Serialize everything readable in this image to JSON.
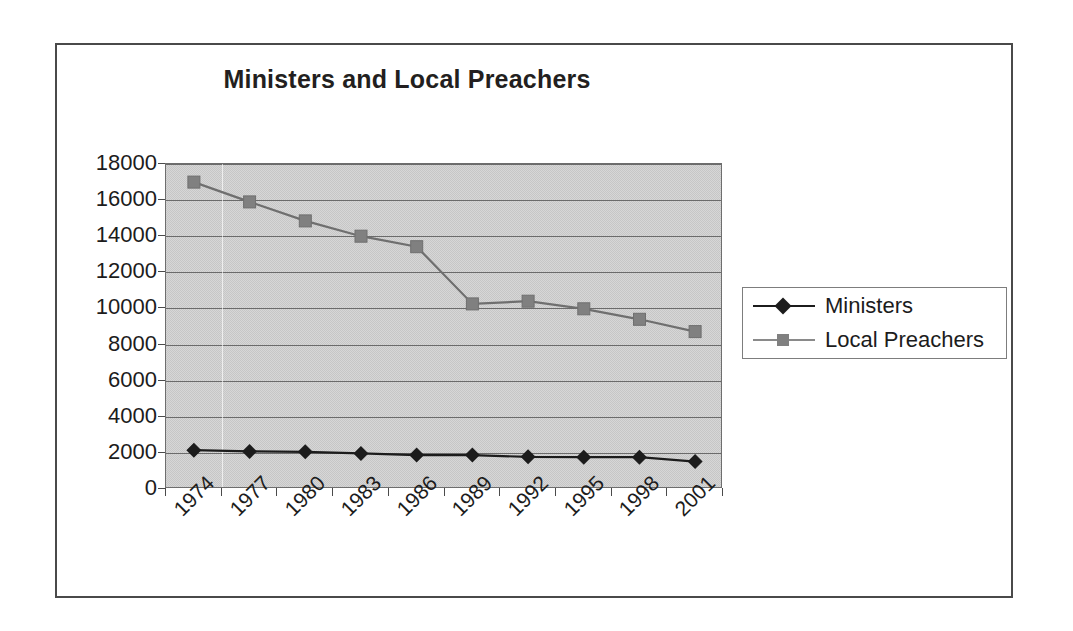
{
  "chart_data": {
    "type": "line",
    "title": "Ministers and Local Preachers",
    "xlabel": "",
    "ylabel": "",
    "x": [
      "1974",
      "1977",
      "1980",
      "1983",
      "1986",
      "1989",
      "1992",
      "1995",
      "1998",
      "2001"
    ],
    "categories": [
      "1974",
      "1977",
      "1980",
      "1983",
      "1986",
      "1989",
      "1992",
      "1995",
      "1998",
      "2001"
    ],
    "ylim": [
      0,
      18000
    ],
    "ytick_labels": [
      "18000",
      "16000",
      "14000",
      "12000",
      "10000",
      "8000",
      "6000",
      "4000",
      "2000",
      "0"
    ],
    "ytick_values": [
      18000,
      16000,
      14000,
      12000,
      10000,
      8000,
      6000,
      4000,
      2000,
      0
    ],
    "grid": true,
    "grid_axis": "y",
    "legend_position": "right",
    "series": [
      {
        "name": "Ministers",
        "color": "#1c1c1c",
        "marker": "diamond",
        "values": [
          2150,
          2080,
          2060,
          1970,
          1880,
          1880,
          1780,
          1760,
          1760,
          1520
        ]
      },
      {
        "name": "Local Preachers",
        "color": "#808080",
        "marker": "square",
        "values": [
          17000,
          15900,
          14850,
          14000,
          13420,
          10250,
          10400,
          9980,
          9400,
          8720
        ]
      }
    ],
    "plot_background_color": "#c6c6c6",
    "frame_border_color": "#4a4a4a"
  },
  "legend": {
    "entries": [
      {
        "label": "Ministers"
      },
      {
        "label": "Local Preachers"
      }
    ]
  }
}
